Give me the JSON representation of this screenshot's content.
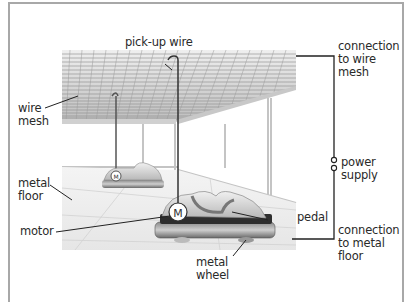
{
  "diagram": {
    "labels": {
      "pickup_wire": "pick-up wire",
      "wire_mesh": "wire\nmesh",
      "metal_floor": "metal\nfloor",
      "motor": "motor",
      "pedal": "pedal",
      "metal_wheel": "metal\nwheel",
      "connection_mesh": "connection\nto wire\nmesh",
      "power_supply": "power\nsupply",
      "connection_floor": "connection\nto metal\nfloor",
      "motor_symbol": "M"
    },
    "colors": {
      "frame": "#a8a8a8",
      "leader": "#222222",
      "mesh": "#9a9a9a",
      "car_body": "#d8d8d8",
      "car_base": "#5a5a5a"
    }
  }
}
